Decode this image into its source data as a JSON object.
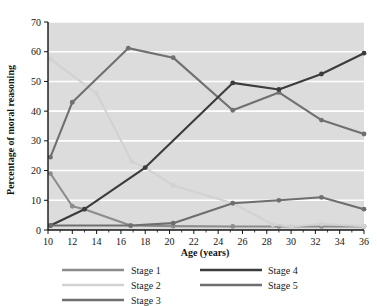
{
  "chart_data": {
    "type": "line",
    "title": "",
    "xlabel": "Age (years)",
    "ylabel": "Percentage of moral reasoning",
    "xlim": [
      10,
      36
    ],
    "ylim": [
      0,
      70
    ],
    "xticks": [
      10,
      12,
      14,
      16,
      18,
      20,
      22,
      24,
      26,
      28,
      30,
      32,
      34,
      36
    ],
    "yticks": [
      0,
      10,
      20,
      30,
      40,
      50,
      60,
      70
    ],
    "xtick_labels": [
      "10",
      "12",
      "14",
      "16",
      "18",
      "20",
      "22",
      "24",
      "26",
      "28",
      "30",
      "32",
      "34",
      "36"
    ],
    "ytick_labels": [
      "0",
      "10",
      "20",
      "30",
      "40",
      "50",
      "60",
      "70"
    ],
    "grid": true,
    "grid_color": "#ffffff",
    "plot_background": "#dcdcdc",
    "legend_position": "below-plot",
    "series": [
      {
        "name": "Stage 1",
        "color": "#8c8c8c",
        "x": [
          10.2,
          12,
          13,
          16.8,
          20.3,
          25.2,
          29,
          32.5,
          36
        ],
        "y": [
          19,
          8,
          7,
          1.5,
          1.3,
          1.2,
          1.2,
          1.2,
          1.2
        ]
      },
      {
        "name": "Stage 2",
        "color": "#d2d2d2",
        "x": [
          10.2,
          14,
          16.9,
          18,
          20.3,
          25.2,
          28.5,
          30,
          32.5,
          36
        ],
        "y": [
          57.5,
          46,
          23,
          21,
          15,
          9,
          1.8,
          1.2,
          2,
          1.3
        ]
      },
      {
        "name": "Stage 3",
        "color": "#707070",
        "x": [
          10.2,
          12,
          16.6,
          20.3,
          25.2,
          29,
          32.5,
          36
        ],
        "y": [
          24.5,
          43,
          61.2,
          58,
          40.3,
          46.3,
          37,
          32.3
        ]
      },
      {
        "name": "Stage 4",
        "color": "#3c3c3c",
        "x": [
          10.2,
          13,
          18,
          25.2,
          29,
          32.5,
          36
        ],
        "y": [
          1.5,
          7,
          21,
          49.5,
          47.3,
          52.5,
          59.5
        ]
      },
      {
        "name": "Stage 5",
        "color": "#6e6e6e",
        "x": [
          10.2,
          16.8,
          20.3,
          25.2,
          29,
          32.5,
          36
        ],
        "y": [
          1.5,
          1.5,
          2.3,
          9,
          10,
          11,
          7
        ]
      }
    ]
  },
  "legend": {
    "column_left": [
      {
        "label": "Stage 1",
        "color": "#8c8c8c"
      },
      {
        "label": "Stage 2",
        "color": "#d2d2d2"
      },
      {
        "label": "Stage 3",
        "color": "#707070"
      }
    ],
    "column_right": [
      {
        "label": "Stage 4",
        "color": "#3c3c3c"
      },
      {
        "label": "Stage 5",
        "color": "#6e6e6e"
      }
    ]
  }
}
